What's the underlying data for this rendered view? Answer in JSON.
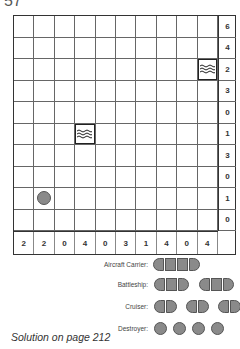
{
  "puzzle": {
    "number": "57",
    "rows": 10,
    "cols": 10,
    "row_clues": [
      "6",
      "4",
      "2",
      "3",
      "0",
      "1",
      "3",
      "0",
      "1",
      "0"
    ],
    "col_clues": [
      "2",
      "2",
      "0",
      "4",
      "0",
      "3",
      "1",
      "4",
      "0",
      "4"
    ],
    "given_cells": [
      {
        "row": 2,
        "col": 9,
        "type": "water"
      },
      {
        "row": 5,
        "col": 3,
        "type": "water"
      },
      {
        "row": 8,
        "col": 1,
        "type": "submarine"
      }
    ]
  },
  "legend": {
    "aircraft_carrier": "Aircraft Carrier:",
    "battleship": "Battleship:",
    "cruiser": "Cruiser:",
    "destroyer": "Destroyer:"
  },
  "footer": "Solution on page 212",
  "colors": {
    "ship_fill": "#8a8a8a",
    "grid_line": "#666666"
  }
}
